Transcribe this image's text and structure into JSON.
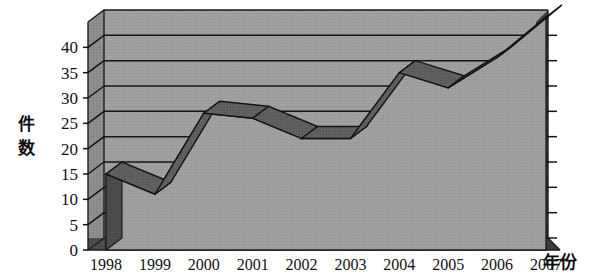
{
  "figure": {
    "background_color": "#ffffff",
    "plot_face_color": "#9d9d9d",
    "plot_top_color": "#8f8f8f",
    "plot_left_wall_color": "#8a8a8a",
    "area_top_color": "#5e5e5e",
    "area_side_color": "#4a4a4a",
    "base_strip_color": "#4f4f4f",
    "right_wall_color": "#3d3d3d",
    "gridline_color": "#1a1a1a",
    "text_color": "#111111"
  },
  "chart_data": {
    "type": "area",
    "title": "",
    "subtitle": "",
    "xlabel": "年份",
    "ylabel": "件数",
    "categories": [
      "1998",
      "1999",
      "2000",
      "2001",
      "2002",
      "2003",
      "2004",
      "2005",
      "2006",
      "2007"
    ],
    "values": [
      15,
      11,
      27,
      26,
      22,
      22,
      35,
      32,
      38,
      46
    ],
    "series": [
      {
        "name": "件数",
        "values": [
          15,
          11,
          27,
          26,
          22,
          22,
          35,
          32,
          38,
          46
        ]
      }
    ],
    "ylim": [
      0,
      45
    ],
    "y_ticks": [
      0,
      5,
      10,
      15,
      20,
      25,
      30,
      35,
      40
    ],
    "y_tick_labels": [
      "0",
      "5",
      "10",
      "15",
      "20",
      "25",
      "30",
      "35",
      "40"
    ],
    "x_tick_labels": [
      "1998",
      "1999",
      "2000",
      "2001",
      "2002",
      "2003",
      "2004",
      "2005",
      "2006",
      "2007"
    ],
    "grid": true,
    "grid_axis": "y",
    "legend": false,
    "legend_position": "none",
    "projection": "3d",
    "annotations": []
  },
  "axes": {
    "y_title": "件数",
    "x_title": "年份",
    "y_labels": [
      "40",
      "35",
      "30",
      "25",
      "20",
      "15",
      "10",
      "5",
      "0"
    ],
    "x_labels": [
      "1998",
      "1999",
      "2000",
      "2001",
      "2002",
      "2003",
      "2004",
      "2005",
      "2006",
      "2007"
    ]
  }
}
